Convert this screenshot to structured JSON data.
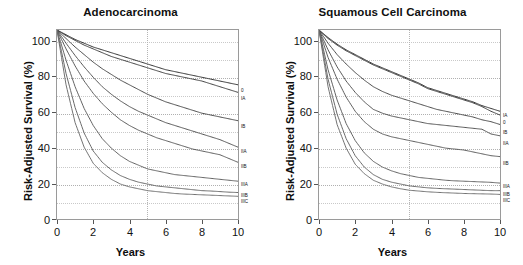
{
  "figure": {
    "axis_x_title": "Years",
    "axis_y_title": "Risk-Adjusted Survival (%)",
    "x_ticks": [
      "0",
      "2",
      "4",
      "6",
      "8",
      "10"
    ],
    "y_ticks": [
      "0",
      "20",
      "40",
      "60",
      "80",
      "100"
    ]
  },
  "panels": [
    {
      "id": "adenocarcinoma",
      "title": "Adenocarcinoma"
    },
    {
      "id": "squamous-cell-carcinoma",
      "title": "Squamous Cell Carcinoma"
    }
  ],
  "chart_data": [
    {
      "type": "line",
      "title": "Adenocarcinoma",
      "xlabel": "Years",
      "ylabel": "Risk-Adjusted Survival (%)",
      "xlim": [
        0,
        10
      ],
      "ylim": [
        0,
        100
      ],
      "xticks": [
        0,
        2,
        4,
        6,
        8,
        10
      ],
      "yticks": [
        0,
        20,
        40,
        60,
        80,
        100
      ],
      "grid": "dotted horizontal every 10 units; dashed vertical at year 5",
      "legend": "inline right-edge curve labels",
      "x": [
        0,
        0.5,
        1,
        1.5,
        2,
        2.5,
        3,
        3.5,
        4,
        4.5,
        5,
        5.5,
        6,
        6.5,
        7,
        7.5,
        8,
        8.5,
        9,
        9.5,
        10
      ],
      "series": [
        {
          "name": "0",
          "label": "0",
          "values": [
            100,
            97.5,
            95,
            93,
            91,
            89.5,
            88,
            86.5,
            85,
            83.5,
            82,
            80.5,
            79,
            78,
            77,
            76,
            75,
            74,
            73,
            72,
            71
          ]
        },
        {
          "name": "IA",
          "label": "IA",
          "values": [
            100,
            97,
            94.5,
            92,
            90,
            88,
            86,
            84.5,
            83,
            81.5,
            80,
            78.5,
            77,
            76,
            75,
            74,
            73,
            71.5,
            70,
            68.5,
            67
          ]
        },
        {
          "name": "IB",
          "label": "IB",
          "values": [
            100,
            95.5,
            91,
            87,
            83,
            79.5,
            76.5,
            73.5,
            71,
            68.5,
            66,
            64,
            62,
            60.5,
            59,
            57.5,
            56,
            55,
            54,
            53,
            52
          ]
        },
        {
          "name": "IIA",
          "label": "IIA",
          "values": [
            100,
            93,
            86.5,
            80.5,
            75,
            70,
            66,
            62.5,
            59.5,
            57,
            55,
            53,
            51,
            49.5,
            48,
            46.5,
            45,
            43.5,
            42,
            40,
            38
          ]
        },
        {
          "name": "IIB",
          "label": "IIB",
          "values": [
            100,
            90,
            81,
            73,
            66.5,
            61,
            56.5,
            52.5,
            49.5,
            47,
            45,
            43,
            41.5,
            40,
            38.5,
            37,
            36,
            35,
            34,
            32,
            30
          ]
        },
        {
          "name": "IIIA",
          "label": "IIIA",
          "values": [
            100,
            84,
            70,
            58.5,
            49.5,
            42.5,
            37.5,
            33.5,
            30.5,
            28.5,
            26.5,
            25.5,
            24.5,
            23.5,
            23,
            22.5,
            22,
            21.5,
            21,
            20.5,
            20
          ]
        },
        {
          "name": "IIIB",
          "label": "IIIB",
          "values": [
            100,
            77,
            59,
            45.5,
            36,
            30,
            26,
            23,
            21,
            19.5,
            18.5,
            17.5,
            17,
            16.5,
            16,
            15.5,
            15,
            14.8,
            14.5,
            14.2,
            14
          ]
        },
        {
          "name": "IIIC",
          "label": "IIIC",
          "values": [
            100,
            71,
            51,
            38,
            29.5,
            24.5,
            21,
            18.5,
            17,
            16,
            15,
            14.5,
            14,
            13.5,
            13.2,
            13,
            12.8,
            12.6,
            12.4,
            12.2,
            12
          ]
        }
      ]
    },
    {
      "type": "line",
      "title": "Squamous Cell Carcinoma",
      "xlabel": "Years",
      "ylabel": "Risk-Adjusted Survival (%)",
      "xlim": [
        0,
        10
      ],
      "ylim": [
        0,
        100
      ],
      "xticks": [
        0,
        2,
        4,
        6,
        8,
        10
      ],
      "yticks": [
        0,
        20,
        40,
        60,
        80,
        100
      ],
      "grid": "dotted horizontal every 10 units; dashed vertical at year 5",
      "legend": "inline right-edge curve labels",
      "x": [
        0,
        0.5,
        1,
        1.5,
        2,
        2.5,
        3,
        3.5,
        4,
        4.5,
        5,
        5.5,
        6,
        6.5,
        7,
        7.5,
        8,
        8.5,
        9,
        9.5,
        10
      ],
      "series": [
        {
          "name": "IA",
          "label": "IA",
          "values": [
            100,
            96,
            92.5,
            89.5,
            87,
            84.5,
            82,
            80,
            78,
            76,
            74,
            72,
            69.5,
            68,
            66.5,
            65,
            63.5,
            62,
            60,
            58.5,
            57
          ]
        },
        {
          "name": "0",
          "label": "0",
          "values": [
            100,
            95.5,
            92,
            89,
            86.5,
            84,
            81.5,
            79.5,
            77.5,
            75.5,
            73.5,
            71.5,
            69,
            67.5,
            66,
            64.5,
            63,
            61.5,
            59.5,
            57,
            55
          ]
        },
        {
          "name": "IB",
          "label": "IB",
          "values": [
            100,
            93,
            87,
            82,
            77.5,
            73.5,
            70,
            67.5,
            65.5,
            64,
            62.5,
            61,
            59.5,
            58,
            57,
            56,
            55,
            54,
            52.5,
            51.5,
            50
          ]
        },
        {
          "name": "IIA",
          "label": "IIA",
          "values": [
            100,
            89.5,
            80.5,
            73,
            67,
            62,
            58,
            56,
            54.5,
            53.5,
            52.5,
            51.5,
            50.5,
            50,
            49.5,
            49,
            48.5,
            48,
            47.5,
            45,
            44
          ]
        },
        {
          "name": "IIB",
          "label": "IIB",
          "values": [
            100,
            85.5,
            74,
            64.5,
            57,
            51.5,
            47.5,
            45,
            43.5,
            42.5,
            41.5,
            40.5,
            39.5,
            38.5,
            37.5,
            37,
            36.5,
            35.5,
            34.5,
            33.5,
            33
          ]
        },
        {
          "name": "IIIA",
          "label": "IIIA",
          "values": [
            100,
            79,
            63,
            50.5,
            41.5,
            35,
            30.5,
            27.5,
            25.5,
            24,
            23,
            22,
            21.5,
            21,
            20.5,
            20.2,
            20,
            19.8,
            19.6,
            19.4,
            19
          ]
        },
        {
          "name": "IIIB",
          "label": "IIIB",
          "values": [
            100,
            74,
            55.5,
            42.5,
            33.5,
            27.5,
            23.5,
            21,
            19.5,
            18.5,
            17.5,
            17,
            16.5,
            16.2,
            16,
            15.8,
            15.6,
            15.4,
            15.2,
            15,
            15
          ]
        },
        {
          "name": "IIIC",
          "label": "IIIC",
          "values": [
            100,
            70,
            50,
            37.5,
            29,
            24,
            20.5,
            18.5,
            17,
            16,
            15.2,
            14.8,
            14.4,
            14.1,
            13.9,
            13.7,
            13.5,
            13.4,
            13.3,
            13.2,
            13
          ]
        }
      ]
    }
  ]
}
